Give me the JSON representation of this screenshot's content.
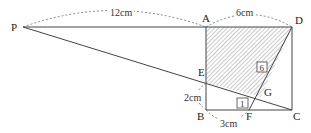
{
  "diagram": {
    "points": {
      "P": {
        "label": "P",
        "x": 23,
        "y": 27
      },
      "A": {
        "label": "A",
        "x": 206,
        "y": 27
      },
      "D": {
        "label": "D",
        "x": 292,
        "y": 27
      },
      "B": {
        "label": "B",
        "x": 206,
        "y": 110
      },
      "C": {
        "label": "C",
        "x": 292,
        "y": 110
      },
      "E": {
        "label": "E",
        "x": 206,
        "y": 83
      },
      "F": {
        "label": "F",
        "x": 249,
        "y": 110
      },
      "G": {
        "label": "G",
        "x": 261,
        "y": 97
      }
    },
    "dimensions": {
      "PA": "12cm",
      "AD": "6cm",
      "EB": "2cm",
      "BF": "3cm"
    },
    "area_boxes": {
      "shaded": "6",
      "triangle": "1"
    },
    "shaded_region": [
      "A",
      "D",
      "G",
      "E"
    ]
  }
}
